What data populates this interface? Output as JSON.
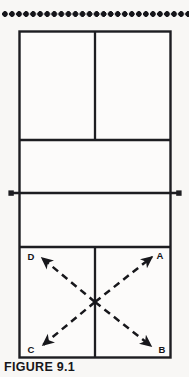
{
  "figure": {
    "caption_label": "FIGURE 9.1",
    "caption_dots_icon": "dot-leader",
    "top_rule_icon": "dot-rule",
    "background_color": "#f8f7f5",
    "line_color": "#1d1d21"
  },
  "court": {
    "name": "court-diagram",
    "outer_boundary": {
      "x": 19,
      "y": 31,
      "width": 152,
      "height": 327
    },
    "upper_center_service_line": {
      "x": 95,
      "y1": 31,
      "y2": 140
    },
    "upper_service_line": {
      "x1": 19,
      "x2": 171,
      "y": 140
    },
    "net_line": {
      "x1": 11,
      "x2": 179,
      "y": 193
    },
    "net_post_left": {
      "x": 11,
      "y": 193
    },
    "net_post_right": {
      "x": 179,
      "y": 193
    },
    "lower_service_line": {
      "x1": 19,
      "x2": 171,
      "y": 247
    },
    "lower_center_service_line": {
      "x": 95,
      "y1": 247,
      "y2": 358
    }
  },
  "arrows": {
    "crossing_point": {
      "x": 95,
      "y": 302
    },
    "style": "dashed-with-arrowhead",
    "items": [
      {
        "label": "D",
        "direction": "up-left",
        "from": {
          "x": 95,
          "y": 302
        },
        "to": {
          "x": 42,
          "y": 258
        },
        "label_pos": {
          "x": 31,
          "y": 256
        }
      },
      {
        "label": "A",
        "direction": "up-right",
        "from": {
          "x": 95,
          "y": 302
        },
        "to": {
          "x": 152,
          "y": 257
        },
        "label_pos": {
          "x": 157,
          "y": 256
        }
      },
      {
        "label": "C",
        "direction": "down-left",
        "from": {
          "x": 95,
          "y": 302
        },
        "to": {
          "x": 43,
          "y": 345
        },
        "label_pos": {
          "x": 30,
          "y": 350
        }
      },
      {
        "label": "B",
        "direction": "down-right",
        "from": {
          "x": 95,
          "y": 302
        },
        "to": {
          "x": 151,
          "y": 346
        },
        "label_pos": {
          "x": 160,
          "y": 351
        }
      }
    ]
  }
}
